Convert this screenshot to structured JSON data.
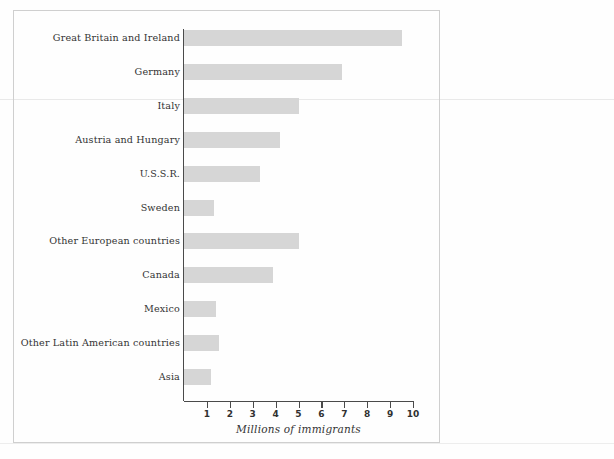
{
  "figure": {
    "frame_color": "#cfcfcf",
    "background": "#fefefe"
  },
  "chart_data": {
    "type": "bar",
    "orientation": "horizontal",
    "title": "",
    "subtitle": "",
    "xlabel": "Millions of immigrants",
    "ylabel": "",
    "xlim": [
      0,
      10
    ],
    "ylim": null,
    "grid": false,
    "legend": null,
    "bar_color": "#d6d6d6",
    "axis_color": "#4a4a4a",
    "xticks": [
      1,
      2,
      3,
      4,
      5,
      6,
      7,
      8,
      9,
      10
    ],
    "xtick_labels": [
      "1",
      "2",
      "3",
      "4",
      "5",
      "6",
      "7",
      "8",
      "9",
      "10"
    ],
    "categories": [
      "Great Britain and Ireland",
      "Germany",
      "Italy",
      "Austria and Hungary",
      "U.S.S.R.",
      "Sweden",
      "Other European countries",
      "Canada",
      "Mexico",
      "Other Latin American countries",
      "Asia"
    ],
    "values": [
      9.5,
      6.9,
      5.0,
      4.2,
      3.3,
      1.3,
      5.0,
      3.9,
      1.4,
      1.55,
      1.2
    ],
    "units": "millions"
  }
}
